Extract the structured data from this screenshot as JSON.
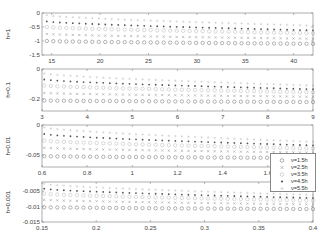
{
  "chart_data": [
    {
      "type": "scatter",
      "title": "",
      "ylabel": "h=1",
      "xlabel": "",
      "xlim": [
        14,
        42
      ],
      "ylim": [
        -1.5,
        0
      ],
      "xticks": [
        15,
        20,
        25,
        30,
        35,
        40
      ],
      "yticks": [
        0,
        -0.5,
        -1,
        -1.5
      ],
      "ytick_labels": [
        "0",
        "-0.5",
        "-1",
        "-1.5"
      ],
      "x_range_points": [
        14.5,
        42
      ],
      "series": [
        {
          "name": "ν=1.5h",
          "y_start": -1.0,
          "y_end": -1.1
        },
        {
          "name": "ν=2.5h",
          "y_start": -0.75,
          "y_end": -0.92
        },
        {
          "name": "ν=3.5h",
          "y_start": -0.5,
          "y_end": -0.72
        },
        {
          "name": "ν=4.5h",
          "y_start": -0.3,
          "y_end": -0.62
        },
        {
          "name": "ν=5.5h",
          "y_start": -0.08,
          "y_end": -0.45
        }
      ]
    },
    {
      "type": "scatter",
      "title": "",
      "ylabel": "h=0.1",
      "xlabel": "",
      "xlim": [
        3,
        9
      ],
      "ylim": [
        -0.28,
        0
      ],
      "xticks": [
        3,
        4,
        5,
        6,
        7,
        8,
        9
      ],
      "yticks": [
        0,
        -0.2
      ],
      "ytick_labels": [
        "0",
        "-0.2"
      ],
      "x_range_points": [
        3.05,
        9
      ],
      "series": [
        {
          "name": "ν=1.5h",
          "y_start": -0.21,
          "y_end": -0.22
        },
        {
          "name": "ν=2.5h",
          "y_start": -0.16,
          "y_end": -0.185
        },
        {
          "name": "ν=3.5h",
          "y_start": -0.11,
          "y_end": -0.155
        },
        {
          "name": "ν=4.5h",
          "y_start": -0.07,
          "y_end": -0.135
        },
        {
          "name": "ν=5.5h",
          "y_start": -0.03,
          "y_end": -0.11
        }
      ]
    },
    {
      "type": "scatter",
      "title": "",
      "ylabel": "h=0.01",
      "xlabel": "",
      "xlim": [
        0.6,
        1.8
      ],
      "ylim": [
        -0.07,
        0
      ],
      "xticks": [
        0.6,
        0.8,
        1,
        1.2,
        1.4,
        1.6
      ],
      "yticks": [
        0,
        -0.05
      ],
      "ytick_labels": [
        "0",
        "-0.05"
      ],
      "x_range_points": [
        0.61,
        1.8
      ],
      "series": [
        {
          "name": "ν=1.5h",
          "y_start": -0.052,
          "y_end": -0.055
        },
        {
          "name": "ν=2.5h",
          "y_start": -0.038,
          "y_end": -0.046
        },
        {
          "name": "ν=3.5h",
          "y_start": -0.026,
          "y_end": -0.039
        },
        {
          "name": "ν=4.5h",
          "y_start": -0.015,
          "y_end": -0.034
        },
        {
          "name": "ν=5.5h",
          "y_start": -0.004,
          "y_end": -0.028
        }
      ]
    },
    {
      "type": "scatter",
      "title": "",
      "ylabel": "h=0.001",
      "xlabel": "",
      "xlim": [
        0.15,
        0.4
      ],
      "ylim": [
        -0.015,
        -0.002
      ],
      "xticks": [
        0.15,
        0.2,
        0.25,
        0.3,
        0.35,
        0.4
      ],
      "yticks": [
        -0.005,
        -0.01,
        -0.015
      ],
      "ytick_labels": [
        "-0.005",
        "-0.01",
        "-0.015"
      ],
      "x_range_points": [
        0.152,
        0.4
      ],
      "series": [
        {
          "name": "ν=1.5h",
          "y_start": -0.0102,
          "y_end": -0.0108
        },
        {
          "name": "ν=2.5h",
          "y_start": -0.0078,
          "y_end": -0.0093
        },
        {
          "name": "ν=3.5h",
          "y_start": -0.0058,
          "y_end": -0.008
        },
        {
          "name": "ν=4.5h",
          "y_start": -0.0042,
          "y_end": -0.0072
        },
        {
          "name": "ν=5.5h",
          "y_start": -0.0026,
          "y_end": -0.0062
        }
      ]
    }
  ],
  "legend": {
    "position": "right, overlapping panels 3-4",
    "entries": [
      {
        "label": "ν=1.5h",
        "marker": "open-circle",
        "color": "#777777"
      },
      {
        "label": "ν=2.5h",
        "marker": "x",
        "color": "#999999"
      },
      {
        "label": "ν=3.5h",
        "marker": "open-circle-light",
        "color": "#bbbbbb"
      },
      {
        "label": "ν=4.5h",
        "marker": "filled-dot",
        "color": "#555555"
      },
      {
        "label": "ν=5.5h",
        "marker": "plus",
        "color": "#c8c8c8"
      }
    ]
  },
  "points_per_series": 42
}
